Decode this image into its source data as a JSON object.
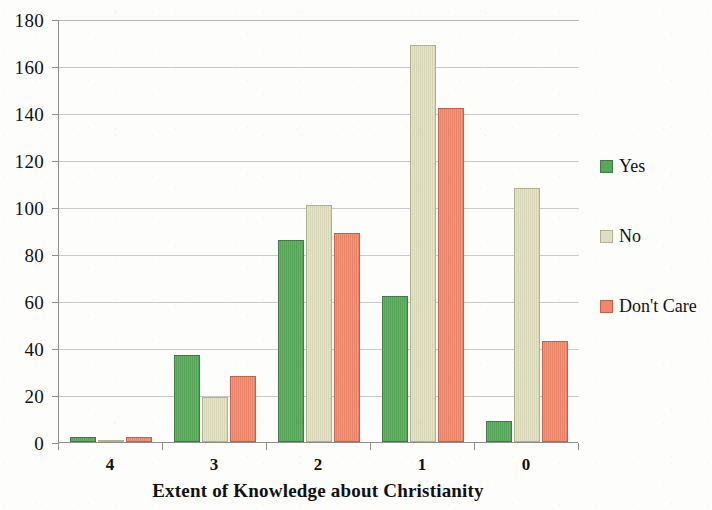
{
  "chart_data": {
    "type": "bar",
    "title": "",
    "subtitle": "",
    "xlabel": "Extent of Knowledge about Christianity",
    "ylabel": "",
    "categories": [
      "4",
      "3",
      "2",
      "1",
      "0"
    ],
    "series": [
      {
        "name": "Yes",
        "color": "#57a85a",
        "values": [
          2,
          37,
          86,
          62,
          9
        ]
      },
      {
        "name": "No",
        "color": "#dedec0",
        "values": [
          1,
          19,
          101,
          169,
          108
        ]
      },
      {
        "name": "Don't Care",
        "color": "#f0876b",
        "values": [
          2,
          28,
          89,
          142,
          43
        ]
      }
    ],
    "ylim": [
      0,
      180
    ],
    "ytick_step": 20,
    "yticks": [
      "0",
      "20",
      "40",
      "60",
      "80",
      "100",
      "120",
      "140",
      "160",
      "180"
    ],
    "grid": true,
    "grid_axis": "y",
    "legend_position": "right",
    "bar_mode": "grouped"
  },
  "legend": {
    "entries": [
      {
        "label": "Yes"
      },
      {
        "label": "No"
      },
      {
        "label": "Don't Care"
      }
    ]
  },
  "axes": {
    "x_title": "Extent of Knowledge about Christianity"
  }
}
